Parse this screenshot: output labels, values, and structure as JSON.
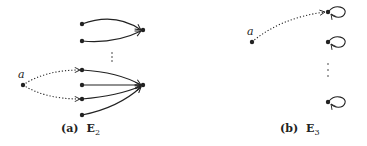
{
  "figure": {
    "subfigures": [
      {
        "id": "a",
        "caption_tag": "(a)",
        "caption_symbol": "E",
        "caption_subscript": "2",
        "node_label": "a",
        "ellipsis": "⋮"
      },
      {
        "id": "b",
        "caption_tag": "(b)",
        "caption_symbol": "E",
        "caption_subscript": "3",
        "node_label": "a",
        "ellipsis": "⋮"
      }
    ]
  }
}
